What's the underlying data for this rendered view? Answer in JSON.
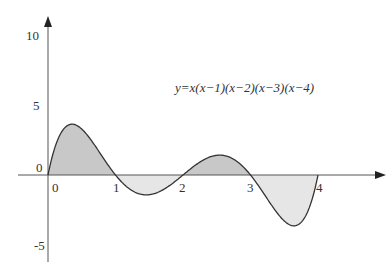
{
  "chart_data": {
    "type": "line",
    "title": "",
    "equation": "y=x(x−1)(x−2)(x−3)(x−4)",
    "xlabel": "",
    "ylabel": "",
    "x_ticks": [
      "0",
      "1",
      "2",
      "3",
      "4"
    ],
    "y_ticks": [
      "10",
      "5",
      "0",
      "-5"
    ],
    "xlim": [
      0,
      4.9
    ],
    "ylim": [
      -6,
      11
    ],
    "grid": false,
    "roots": [
      0,
      1,
      2,
      3,
      4
    ],
    "shaded_regions": [
      {
        "from": 0,
        "to": 1,
        "sign": "positive",
        "color": "#c8c8c8"
      },
      {
        "from": 1,
        "to": 2,
        "sign": "negative",
        "color": "#e6e6e6"
      },
      {
        "from": 2,
        "to": 3,
        "sign": "positive",
        "color": "#c8c8c8"
      },
      {
        "from": 3,
        "to": 4,
        "sign": "negative",
        "color": "#e6e6e6"
      }
    ],
    "series": [
      {
        "name": "y=x(x-1)(x-2)(x-3)(x-4)",
        "x": [
          0,
          0.36,
          1,
          1.5,
          2,
          2.5,
          3,
          3.64,
          4
        ],
        "y": [
          0,
          3.63,
          0,
          -1.41,
          0,
          1.41,
          0,
          -3.63,
          0
        ]
      }
    ]
  },
  "labels": {
    "equation": "y=x(x−1)(x−2)(x−3)(x−4)",
    "x_ticks": [
      "0",
      "1",
      "2",
      "3",
      "4"
    ],
    "y_ticks": [
      "10",
      "5",
      "0",
      "-5"
    ]
  },
  "colors": {
    "axis": "#555555",
    "curve": "#333333",
    "positive_fill": "#c8c8c8",
    "negative_fill": "#e6e6e6"
  }
}
